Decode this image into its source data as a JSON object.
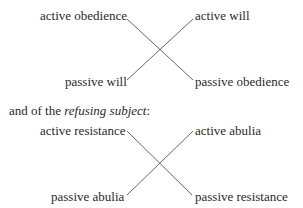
{
  "diagram_obedient": {
    "top_left": "active obedience",
    "top_right": "active will",
    "bottom_left": "passive will",
    "bottom_right": "passive obedience"
  },
  "paragraph": {
    "prefix": "and of the ",
    "emphasis": "refusing subject",
    "suffix": ":"
  },
  "diagram_refusing": {
    "top_left": "active resistance",
    "top_right": "active abulia",
    "bottom_left": "passive abulia",
    "bottom_right": "passive resistance"
  },
  "colors": {
    "text": "#2a2a2a",
    "line": "#555555",
    "background": "#ffffff"
  }
}
